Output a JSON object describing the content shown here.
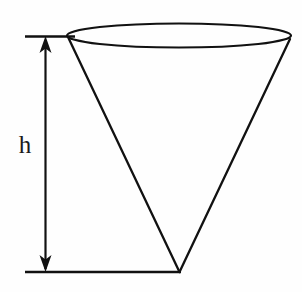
{
  "figure": {
    "type": "geometry-diagram",
    "shape": "inverted-circular-cone",
    "background_color": "#fefefe",
    "stroke_color": "#111111",
    "labels": {
      "height": "h"
    },
    "geometry": {
      "canvas": {
        "width": 302,
        "height": 292
      },
      "ellipse_rim": {
        "center_x": 179,
        "center_y": 35,
        "radius_x": 112,
        "radius_y": 12,
        "left_tip_x": 67,
        "left_tip_y": 36,
        "right_tip_x": 291,
        "right_tip_y": 39
      },
      "apex": {
        "x": 179,
        "y": 272
      },
      "left_slant": {
        "x1": 68,
        "y1": 37,
        "x2": 179,
        "y2": 272
      },
      "right_slant": {
        "x1": 290,
        "y1": 39,
        "x2": 179,
        "y2": 272
      },
      "top_reference_line": {
        "x1": 25,
        "y1": 36,
        "x2": 74,
        "y2": 36
      },
      "bottom_reference_line": {
        "x1": 25,
        "y1": 272,
        "x2": 181,
        "y2": 272
      },
      "dimension_arrow": {
        "x": 45,
        "y_top": 37,
        "y_bottom": 272,
        "arrowhead_half_width": 6,
        "arrowhead_length": 15
      },
      "label_h_position": {
        "x": 22,
        "y": 146
      }
    }
  }
}
